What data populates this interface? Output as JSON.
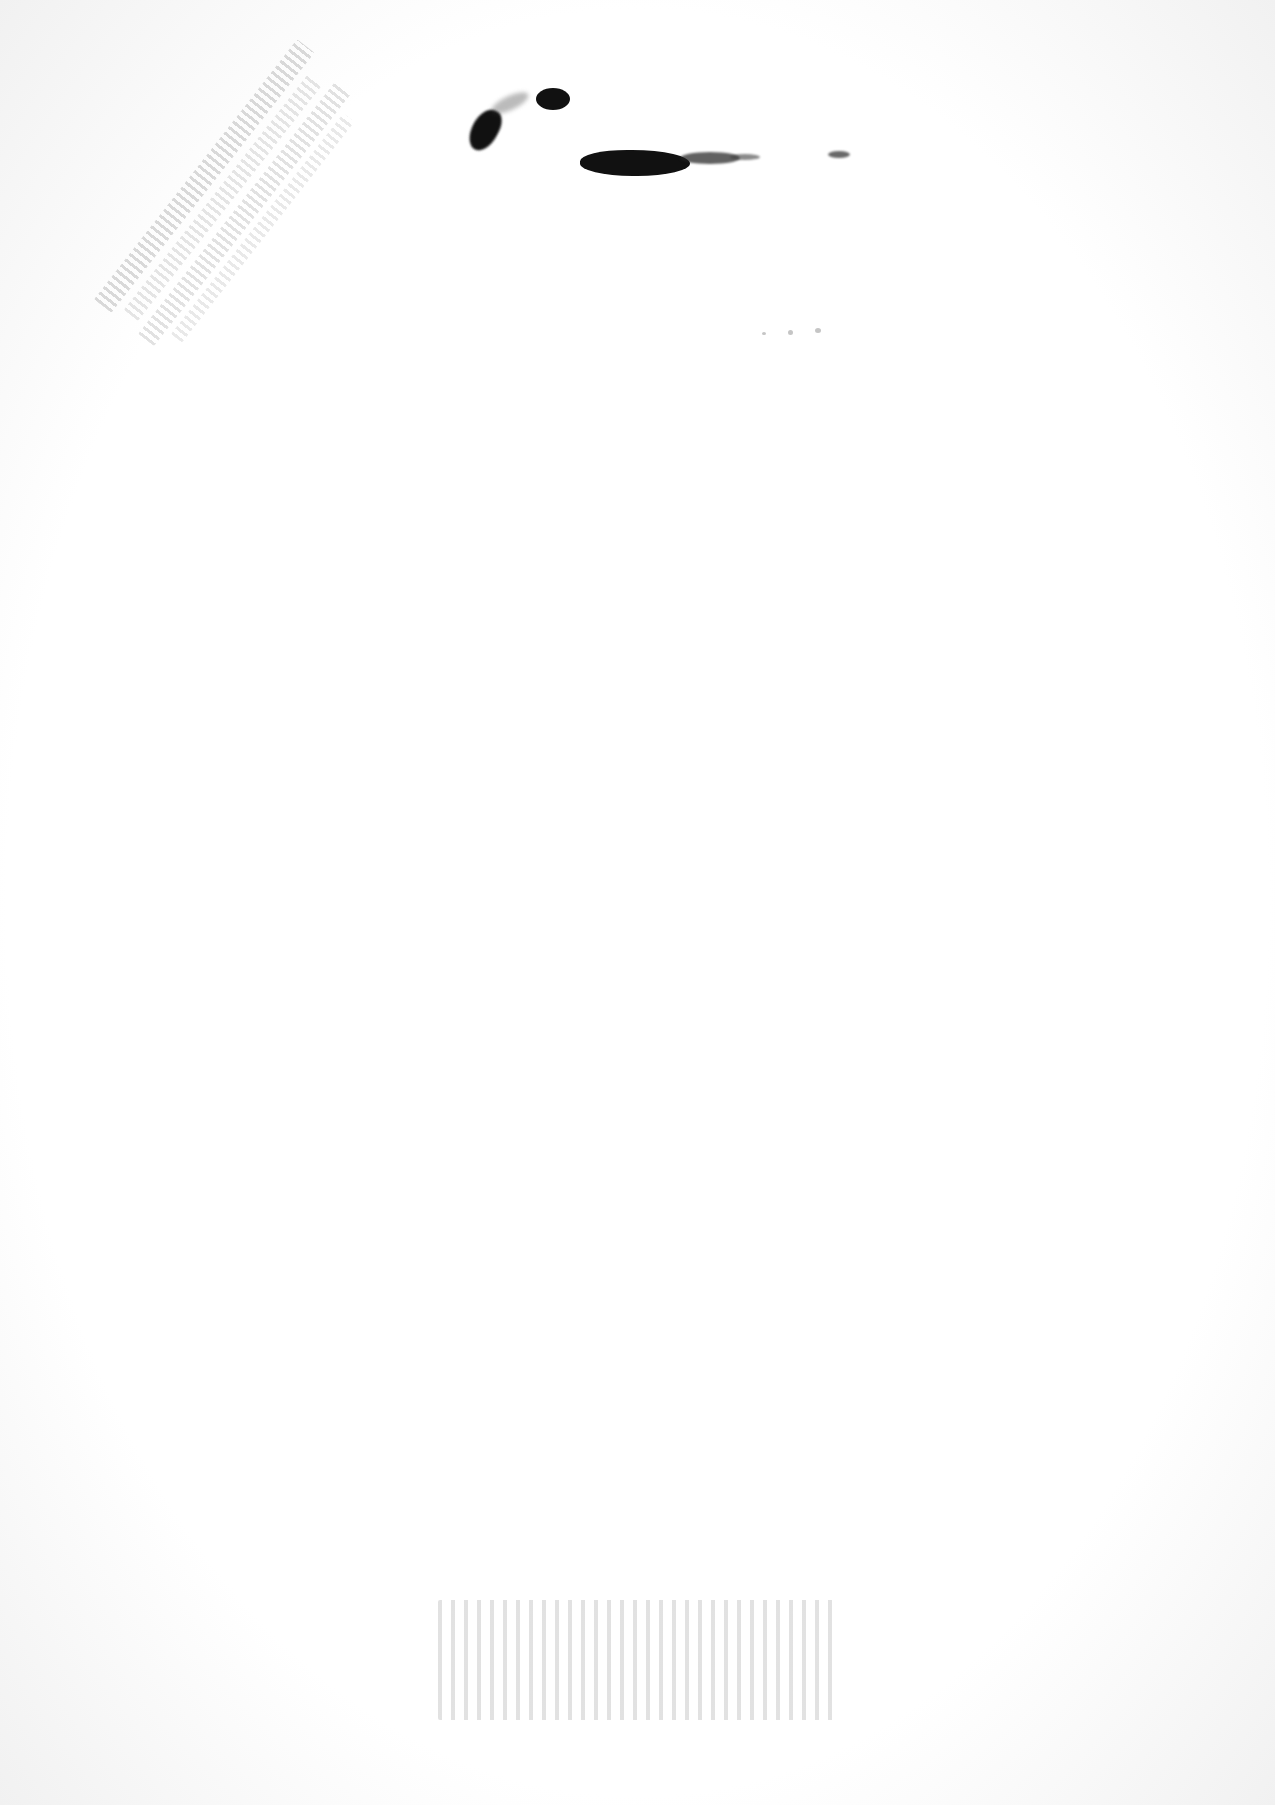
{
  "document": {
    "type": "scanned-page",
    "background": "#ffffff",
    "text_content": "",
    "marks": [
      {
        "kind": "ink-smudge",
        "color": "#111111",
        "region": "top-center"
      },
      {
        "kind": "faded-stamp",
        "orientation": "diagonal",
        "region": "top-left",
        "legible": false
      },
      {
        "kind": "faded-stamp",
        "orientation": "horizontal",
        "region": "bottom-center",
        "legible": false
      }
    ]
  }
}
